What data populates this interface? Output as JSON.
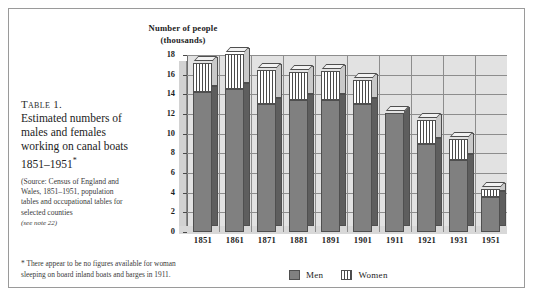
{
  "caption": {
    "table_label": "Table 1.",
    "title_lines": [
      "Estimated numbers of",
      "males and females",
      "working on canal boats",
      "1851–1951"
    ],
    "title_marker": "*",
    "source_lines": [
      "(Source: Census of England and",
      "Wales, 1851–1951, population",
      "tables and occupational tables for",
      "selected counties"
    ],
    "see_note": "(see note 22)"
  },
  "footnote": {
    "lines": [
      "* There appear to be no figures available for woman",
      "sleeping on board inland boats and barges in 1911."
    ]
  },
  "legend": {
    "men_label": "Men",
    "women_label": "Women"
  },
  "colors": {
    "men": "#808080",
    "women_stripe": "#4a4a4a",
    "women_base": "#ffffff",
    "plot_background": "#e2e2e2",
    "grid": "#8d8d8d",
    "axis": "#6d6d6d",
    "page": "#ffffff",
    "frame": "#9a9a9a"
  },
  "chart_data": {
    "type": "bar",
    "title": "Number of people (thousands)",
    "title_lines": [
      "Number of people",
      "(thousands)"
    ],
    "xlabel": "",
    "ylabel": "Number of people (thousands)",
    "ylim": [
      0,
      18
    ],
    "ytick_labels": [
      "0",
      "2",
      "4",
      "6",
      "8",
      "10",
      "12",
      "14",
      "16",
      "18"
    ],
    "yticks": [
      0,
      2,
      4,
      6,
      8,
      10,
      12,
      14,
      16,
      18
    ],
    "grid": true,
    "stacked": true,
    "legend_position": "bottom-right",
    "categories": [
      "1851",
      "1861",
      "1871",
      "1881",
      "1891",
      "1901",
      "1911",
      "1921",
      "1931",
      "1951"
    ],
    "series": [
      {
        "name": "Men",
        "values": [
          14.2,
          14.5,
          13.0,
          13.4,
          13.4,
          13.0,
          12.1,
          8.9,
          7.3,
          3.6
        ]
      },
      {
        "name": "Women",
        "values": [
          3.0,
          3.6,
          3.5,
          2.9,
          3.0,
          2.5,
          0.0,
          2.5,
          2.2,
          0.8
        ]
      }
    ],
    "totals": [
      17.2,
      18.1,
      16.5,
      16.3,
      16.4,
      15.5,
      12.1,
      11.4,
      9.5,
      4.4
    ]
  }
}
